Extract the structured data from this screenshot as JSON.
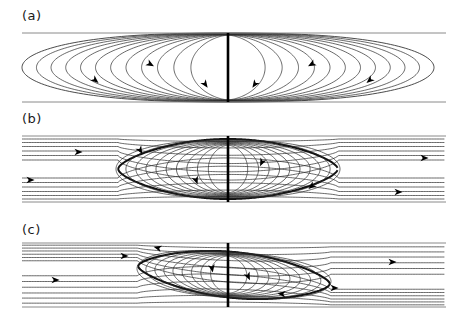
{
  "figure": {
    "type": "streamline-plot",
    "background": "#ffffff",
    "width": 463,
    "height": 325,
    "line_color": "#2a2a2a",
    "wall_color": "#8a8a8a",
    "plate_color": "#000000",
    "arrow_color": "#000000"
  },
  "panels": [
    {
      "id": "a",
      "label": "(a)",
      "label_x": 22,
      "label_y": 8,
      "channel": {
        "x0": 22,
        "x1": 446,
        "y_top": 33,
        "y_bottom": 102,
        "plate_x": 228
      },
      "description": "closed nested elliptical streamlines, symmetric, no through-flow",
      "has_through_flow": false,
      "symmetric": true,
      "n_contours_per_side": 12,
      "arrows": [
        {
          "x": 95,
          "y": 80,
          "angle": 40
        },
        {
          "x": 150,
          "y": 64,
          "angle": 30
        },
        {
          "x": 205,
          "y": 84,
          "angle": 55
        },
        {
          "x": 255,
          "y": 84,
          "angle": 125
        },
        {
          "x": 312,
          "y": 64,
          "angle": 150
        },
        {
          "x": 370,
          "y": 80,
          "angle": 140
        }
      ]
    },
    {
      "id": "b",
      "label": "(b)",
      "label_x": 22,
      "label_y": 115,
      "channel": {
        "x0": 22,
        "x1": 446,
        "y_top": 136,
        "y_bottom": 202,
        "plate_x": 228
      },
      "description": "through-flow with symmetric lens-shaped recirculation bubble about the plate",
      "has_through_flow": true,
      "symmetric": true,
      "n_contours_per_side": 10,
      "separatrix": {
        "x_left": 118,
        "x_right": 338,
        "tilt": 0
      },
      "arrows": [
        {
          "x": 30,
          "y": 180,
          "angle": 0
        },
        {
          "x": 78,
          "y": 152,
          "angle": 0
        },
        {
          "x": 140,
          "y": 150,
          "angle": 60
        },
        {
          "x": 196,
          "y": 180,
          "angle": 70
        },
        {
          "x": 262,
          "y": 162,
          "angle": 115
        },
        {
          "x": 312,
          "y": 186,
          "angle": 140
        },
        {
          "x": 398,
          "y": 192,
          "angle": 0
        },
        {
          "x": 424,
          "y": 158,
          "angle": 0
        }
      ]
    },
    {
      "id": "c",
      "label": "(c)",
      "label_x": 22,
      "label_y": 222,
      "channel": {
        "x0": 22,
        "x1": 446,
        "y_top": 243,
        "y_bottom": 307,
        "plate_x": 228
      },
      "description": "through-flow with asymmetric tilted recirculation bubble about the plate",
      "has_through_flow": true,
      "symmetric": false,
      "n_contours_per_side": 9,
      "separatrix": {
        "x_left": 138,
        "x_right": 330,
        "tilt": -1
      },
      "arrows": [
        {
          "x": 55,
          "y": 280,
          "angle": 0
        },
        {
          "x": 124,
          "y": 256,
          "angle": 0
        },
        {
          "x": 158,
          "y": 248,
          "angle": 195
        },
        {
          "x": 212,
          "y": 268,
          "angle": 80
        },
        {
          "x": 248,
          "y": 276,
          "angle": 65
        },
        {
          "x": 282,
          "y": 294,
          "angle": 185
        },
        {
          "x": 334,
          "y": 288,
          "angle": 0
        },
        {
          "x": 392,
          "y": 262,
          "angle": 0
        }
      ]
    }
  ],
  "chart_data": {
    "type": "line",
    "title": "",
    "xlabel": "",
    "ylabel": "",
    "subplots": [
      {
        "label": "(a)",
        "series_count": 24,
        "flow": "closed recirculation only"
      },
      {
        "label": "(b)",
        "series_count": 30,
        "flow": "uniform through-flow plus symmetric separation bubble"
      },
      {
        "label": "(c)",
        "series_count": 30,
        "flow": "uniform through-flow plus asymmetric separation bubble"
      }
    ]
  }
}
